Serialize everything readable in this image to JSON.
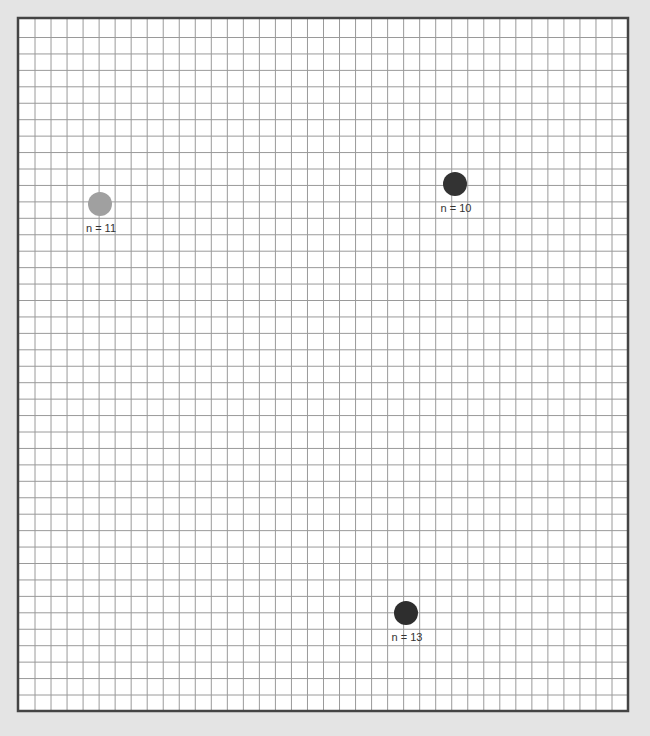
{
  "board": {
    "background": "#e4e4e4",
    "panel_fill": "#ffffff",
    "border_color": "#444444",
    "grid_color": "#9a9a9a"
  },
  "markers": [
    {
      "id": "marker-1",
      "label": "n = 11",
      "x": 100,
      "y": 204,
      "r": 12,
      "color": "#a0a0a0"
    },
    {
      "id": "marker-2",
      "label": "n = 10",
      "x": 455,
      "y": 184,
      "r": 12,
      "color": "#333333"
    },
    {
      "id": "marker-3",
      "label": "n = 13",
      "x": 406,
      "y": 613,
      "r": 12,
      "color": "#2e2e2e"
    }
  ]
}
